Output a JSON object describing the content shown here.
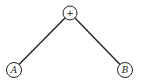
{
  "diagram": {
    "type": "expression-tree",
    "root": {
      "label": "+",
      "cx": 70,
      "cy": 13,
      "r": 7
    },
    "children": [
      {
        "label": "A",
        "cx": 14,
        "cy": 70,
        "r": 7.5
      },
      {
        "label": "B",
        "cx": 125,
        "cy": 70,
        "r": 7.5
      }
    ],
    "colors": {
      "stroke": "#222222",
      "background": "#ffffff"
    }
  }
}
